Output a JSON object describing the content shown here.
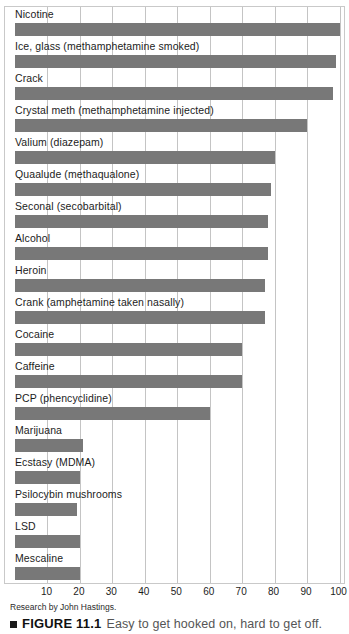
{
  "figure": {
    "caption_marker": "■",
    "caption_number": "FIGURE 11.1",
    "caption_text": "Easy to get hooked on, hard to get off.",
    "source_note": "Research by John Hastings."
  },
  "chart_data": {
    "type": "bar",
    "orientation": "horizontal",
    "title": "",
    "xlabel": "",
    "ylabel": "",
    "xlim": [
      0,
      105
    ],
    "xticks": [
      10,
      20,
      30,
      40,
      50,
      60,
      70,
      80,
      90,
      100
    ],
    "grid": true,
    "legend": "none",
    "bar_color": "#787878",
    "categories": [
      "Nicotine",
      "Ice, glass (methamphetamine smoked)",
      "Crack",
      "Crystal meth (methamphetamine injected)",
      "Valium (diazepam)",
      "Quaalude (methaqualone)",
      "Seconal (secobarbital)",
      "Alcohol",
      "Heroin",
      "Crank (amphetamine taken nasally)",
      "Cocaine",
      "Caffeine",
      "PCP (phencyclidine)",
      "Marijuana",
      "Ecstasy (MDMA)",
      "Psilocybin mushrooms",
      "LSD",
      "Mescaline"
    ],
    "values": [
      100,
      99,
      98,
      90,
      80,
      79,
      78,
      78,
      77,
      77,
      70,
      70,
      60,
      21,
      20,
      19,
      20,
      20
    ]
  }
}
